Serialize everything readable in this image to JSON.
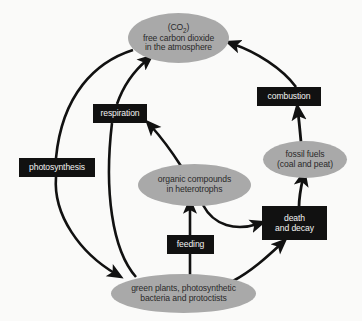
{
  "diagram": {
    "background_color": "#fafaf9",
    "ellipse_color": "#a9a9a9",
    "box_color": "#111111",
    "box_text_color": "#f2f2f2",
    "ellipse_text_color": "#2a2a2a",
    "arrow_color": "#111111",
    "nodes": {
      "co2": {
        "shape": "ellipse",
        "line1": "(CO",
        "line1_sub": "2",
        "line1_end": ")",
        "line2": "free carbon dioxide",
        "line3": "in the atmosphere"
      },
      "respiration": {
        "shape": "box",
        "label": "respiration"
      },
      "photosynthesis": {
        "shape": "box",
        "label": "photosynthesis"
      },
      "combustion": {
        "shape": "box",
        "label": "combustion"
      },
      "fossil_fuels": {
        "shape": "ellipse",
        "line1": "fossil fuels",
        "line2": "(coal and peat)"
      },
      "organic_compounds": {
        "shape": "ellipse",
        "line1": "organic compounds",
        "line2": "in heterotrophs"
      },
      "death_and_decay": {
        "shape": "box",
        "line1": "death",
        "line2": "and decay"
      },
      "feeding": {
        "shape": "box",
        "label": "feeding"
      },
      "green_plants": {
        "shape": "ellipse",
        "line1": "green plants, photosynthetic",
        "line2": "bacteria and protoctists"
      }
    },
    "edges": [
      {
        "from": "co2",
        "to": "green_plants",
        "via": "photosynthesis"
      },
      {
        "from": "green_plants",
        "to": "co2",
        "via": "respiration"
      },
      {
        "from": "organic_compounds",
        "to": "respiration",
        "via": ""
      },
      {
        "from": "green_plants",
        "to": "organic_compounds",
        "via": "feeding"
      },
      {
        "from": "organic_compounds",
        "to": "death_and_decay",
        "via": ""
      },
      {
        "from": "green_plants",
        "to": "death_and_decay",
        "via": ""
      },
      {
        "from": "death_and_decay",
        "to": "fossil_fuels",
        "via": ""
      },
      {
        "from": "fossil_fuels",
        "to": "combustion",
        "via": ""
      },
      {
        "from": "combustion",
        "to": "co2",
        "via": ""
      }
    ]
  }
}
